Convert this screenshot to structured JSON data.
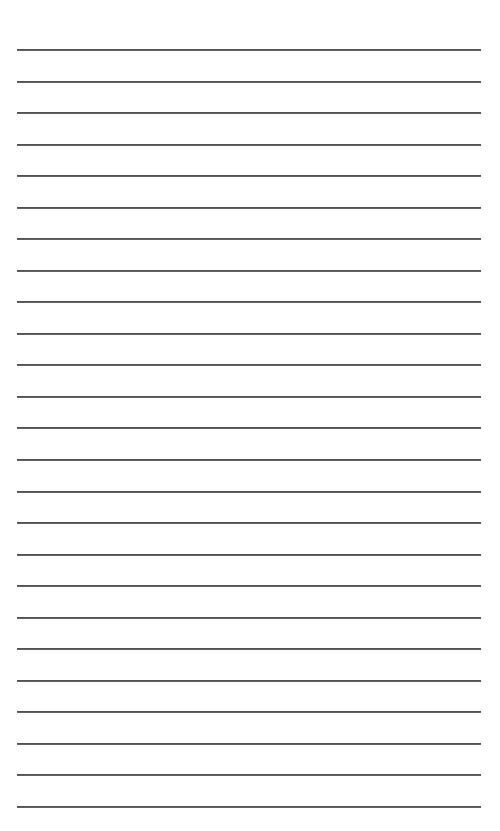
{
  "document": {
    "type": "lined-paper",
    "background_color": "#ffffff",
    "line_color": "#4a4a4a",
    "line_count": 25,
    "first_line_y": 50,
    "line_spacing": 31.54,
    "line_left": 17,
    "line_right": 481,
    "lines": [
      {
        "index": 1,
        "text": ""
      },
      {
        "index": 2,
        "text": ""
      },
      {
        "index": 3,
        "text": ""
      },
      {
        "index": 4,
        "text": ""
      },
      {
        "index": 5,
        "text": ""
      },
      {
        "index": 6,
        "text": ""
      },
      {
        "index": 7,
        "text": ""
      },
      {
        "index": 8,
        "text": ""
      },
      {
        "index": 9,
        "text": ""
      },
      {
        "index": 10,
        "text": ""
      },
      {
        "index": 11,
        "text": ""
      },
      {
        "index": 12,
        "text": ""
      },
      {
        "index": 13,
        "text": ""
      },
      {
        "index": 14,
        "text": ""
      },
      {
        "index": 15,
        "text": ""
      },
      {
        "index": 16,
        "text": ""
      },
      {
        "index": 17,
        "text": ""
      },
      {
        "index": 18,
        "text": ""
      },
      {
        "index": 19,
        "text": ""
      },
      {
        "index": 20,
        "text": ""
      },
      {
        "index": 21,
        "text": ""
      },
      {
        "index": 22,
        "text": ""
      },
      {
        "index": 23,
        "text": ""
      },
      {
        "index": 24,
        "text": ""
      },
      {
        "index": 25,
        "text": ""
      }
    ]
  }
}
